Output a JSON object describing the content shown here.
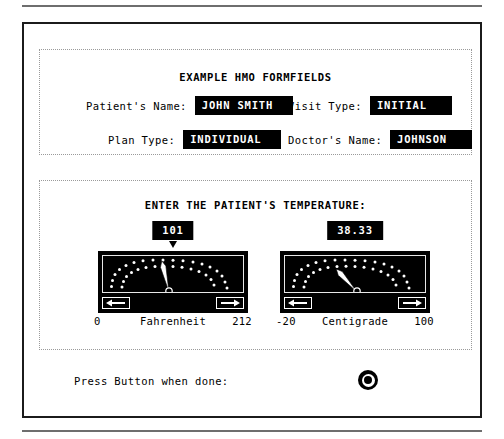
{
  "document": {
    "rule_top": "horizontal-rule",
    "rule_bottom": "horizontal-rule"
  },
  "form_section": {
    "title": "EXAMPLE HMO FORMFIELDS",
    "fields": [
      {
        "label": "Patient's Name:",
        "value": "JOHN SMITH"
      },
      {
        "label": "Visit Type:",
        "value": "INITIAL"
      },
      {
        "label": "Plan Type:",
        "value": "INDIVIDUAL"
      },
      {
        "label": "Doctor's Name:",
        "value": "JOHNSON"
      }
    ]
  },
  "temperature_section": {
    "title": "ENTER THE PATIENT'S TEMPERATURE:",
    "gauges": [
      {
        "readout": "101",
        "unit_label": "Fahrenheit",
        "scale_min": "0",
        "scale_max": "212",
        "value": 101,
        "min": 0,
        "max": 212,
        "decrement_label": "◀",
        "increment_label": "▶",
        "needle_angle_deg": -13
      },
      {
        "readout": "38.33",
        "unit_label": "Centigrade",
        "scale_min": "-20",
        "scale_max": "100",
        "value": 38.33,
        "min": -20,
        "max": 100,
        "decrement_label": "◀",
        "increment_label": "▶",
        "needle_angle_deg": -42
      }
    ]
  },
  "footer": {
    "prompt": "Press Button when done:",
    "button_label": "submit"
  },
  "colors": {
    "ink": "#000000",
    "paper": "#ffffff",
    "field_bg": "#000000",
    "field_fg": "#ffffff",
    "group_border": "#9a9a9a",
    "panel_border": "#1b1b1b",
    "rule": "#6e6e6e",
    "dial_dots": "#ffffff"
  }
}
